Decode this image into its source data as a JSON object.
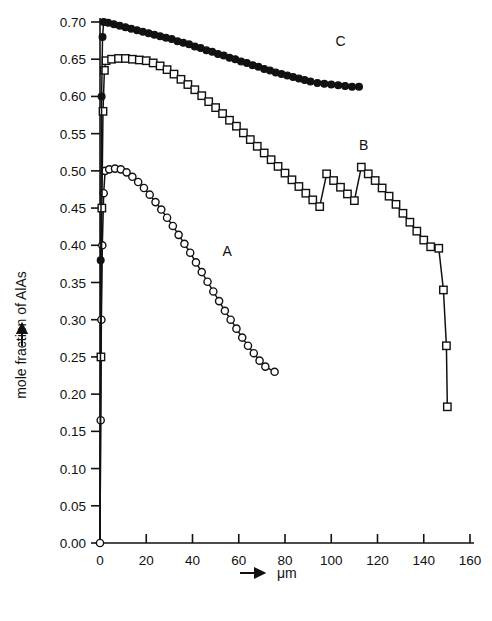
{
  "chart_data": {
    "type": "line",
    "title": "",
    "subtitle": "",
    "xlabel": "μm",
    "xlabel_prefix_icon": "right-arrow",
    "ylabel": "mole fraction of AlAs",
    "ylabel_prefix_icon": "up-arrow",
    "xlim": [
      0,
      160
    ],
    "ylim": [
      0.0,
      0.7
    ],
    "grid": false,
    "legend": "inline-labels",
    "legend_position": "inline",
    "xticks": [
      0,
      20,
      40,
      60,
      80,
      100,
      120,
      140,
      160
    ],
    "xticklabels": [
      "0",
      "20",
      "40",
      "60",
      "80",
      "100",
      "120",
      "140",
      "160"
    ],
    "yticks": [
      0.0,
      0.05,
      0.1,
      0.15,
      0.2,
      0.25,
      0.3,
      0.35,
      0.4,
      0.45,
      0.5,
      0.55,
      0.6,
      0.65,
      0.7
    ],
    "yticklabels": [
      "0.00",
      "0.05",
      "0.10",
      "0.15",
      "0.20",
      "0.25",
      "0.30",
      "0.35",
      "0.40",
      "0.45",
      "0.50",
      "0.55",
      "0.60",
      "0.65",
      "0.70"
    ],
    "series": [
      {
        "name": "A",
        "label": "A",
        "marker": "open-circle",
        "color": "#111111",
        "label_x": 55,
        "label_y": 0.385,
        "points": [
          {
            "x": 0.0,
            "y": 0.0
          },
          {
            "x": 0.3,
            "y": 0.165
          },
          {
            "x": 0.6,
            "y": 0.3
          },
          {
            "x": 1.0,
            "y": 0.4
          },
          {
            "x": 1.6,
            "y": 0.47
          },
          {
            "x": 2.2,
            "y": 0.5
          },
          {
            "x": 4.0,
            "y": 0.502
          },
          {
            "x": 6.5,
            "y": 0.503
          },
          {
            "x": 9.0,
            "y": 0.502
          },
          {
            "x": 11.5,
            "y": 0.498
          },
          {
            "x": 14.0,
            "y": 0.492
          },
          {
            "x": 16.5,
            "y": 0.485
          },
          {
            "x": 19.0,
            "y": 0.477
          },
          {
            "x": 21.5,
            "y": 0.468
          },
          {
            "x": 24.0,
            "y": 0.458
          },
          {
            "x": 26.5,
            "y": 0.448
          },
          {
            "x": 29.0,
            "y": 0.437
          },
          {
            "x": 31.5,
            "y": 0.426
          },
          {
            "x": 34.0,
            "y": 0.414
          },
          {
            "x": 36.5,
            "y": 0.402
          },
          {
            "x": 39.0,
            "y": 0.39
          },
          {
            "x": 41.5,
            "y": 0.377
          },
          {
            "x": 44.0,
            "y": 0.364
          },
          {
            "x": 46.5,
            "y": 0.351
          },
          {
            "x": 49.0,
            "y": 0.338
          },
          {
            "x": 51.5,
            "y": 0.325
          },
          {
            "x": 54.0,
            "y": 0.312
          },
          {
            "x": 56.5,
            "y": 0.3
          },
          {
            "x": 59.0,
            "y": 0.288
          },
          {
            "x": 61.5,
            "y": 0.276
          },
          {
            "x": 64.0,
            "y": 0.265
          },
          {
            "x": 66.5,
            "y": 0.255
          },
          {
            "x": 69.0,
            "y": 0.245
          },
          {
            "x": 71.5,
            "y": 0.237
          },
          {
            "x": 75.5,
            "y": 0.23
          }
        ]
      },
      {
        "name": "B",
        "label": "B",
        "marker": "open-square",
        "color": "#111111",
        "label_x": 114,
        "label_y": 0.528,
        "points": [
          {
            "x": 0.0,
            "y": 0.0
          },
          {
            "x": 0.4,
            "y": 0.25
          },
          {
            "x": 0.8,
            "y": 0.45
          },
          {
            "x": 1.3,
            "y": 0.58
          },
          {
            "x": 1.9,
            "y": 0.635
          },
          {
            "x": 2.6,
            "y": 0.648
          },
          {
            "x": 5.0,
            "y": 0.65
          },
          {
            "x": 8.0,
            "y": 0.651
          },
          {
            "x": 11.0,
            "y": 0.651
          },
          {
            "x": 14.0,
            "y": 0.65
          },
          {
            "x": 17.0,
            "y": 0.649
          },
          {
            "x": 20.0,
            "y": 0.648
          },
          {
            "x": 23.0,
            "y": 0.645
          },
          {
            "x": 26.0,
            "y": 0.641
          },
          {
            "x": 29.0,
            "y": 0.636
          },
          {
            "x": 32.0,
            "y": 0.63
          },
          {
            "x": 35.0,
            "y": 0.623
          },
          {
            "x": 38.0,
            "y": 0.616
          },
          {
            "x": 41.0,
            "y": 0.609
          },
          {
            "x": 44.0,
            "y": 0.601
          },
          {
            "x": 47.0,
            "y": 0.593
          },
          {
            "x": 50.0,
            "y": 0.585
          },
          {
            "x": 53.0,
            "y": 0.577
          },
          {
            "x": 56.0,
            "y": 0.568
          },
          {
            "x": 59.0,
            "y": 0.56
          },
          {
            "x": 62.0,
            "y": 0.551
          },
          {
            "x": 65.0,
            "y": 0.542
          },
          {
            "x": 68.0,
            "y": 0.533
          },
          {
            "x": 71.0,
            "y": 0.524
          },
          {
            "x": 74.0,
            "y": 0.515
          },
          {
            "x": 77.0,
            "y": 0.506
          },
          {
            "x": 80.0,
            "y": 0.497
          },
          {
            "x": 83.0,
            "y": 0.488
          },
          {
            "x": 86.0,
            "y": 0.479
          },
          {
            "x": 89.0,
            "y": 0.47
          },
          {
            "x": 92.0,
            "y": 0.461
          },
          {
            "x": 95.0,
            "y": 0.452
          },
          {
            "x": 98.0,
            "y": 0.496
          },
          {
            "x": 101.0,
            "y": 0.487
          },
          {
            "x": 104.0,
            "y": 0.478
          },
          {
            "x": 107.0,
            "y": 0.469
          },
          {
            "x": 110.0,
            "y": 0.46
          },
          {
            "x": 113.0,
            "y": 0.505
          },
          {
            "x": 116.0,
            "y": 0.496
          },
          {
            "x": 119.0,
            "y": 0.487
          },
          {
            "x": 122.0,
            "y": 0.477
          },
          {
            "x": 125.0,
            "y": 0.466
          },
          {
            "x": 128.0,
            "y": 0.455
          },
          {
            "x": 131.0,
            "y": 0.443
          },
          {
            "x": 134.0,
            "y": 0.431
          },
          {
            "x": 137.0,
            "y": 0.419
          },
          {
            "x": 140.0,
            "y": 0.407
          },
          {
            "x": 143.0,
            "y": 0.398
          },
          {
            "x": 146.5,
            "y": 0.396
          },
          {
            "x": 148.5,
            "y": 0.34
          },
          {
            "x": 149.8,
            "y": 0.265
          },
          {
            "x": 150.2,
            "y": 0.183
          }
        ]
      },
      {
        "name": "C",
        "label": "C",
        "marker": "filled-circle",
        "color": "#111111",
        "label_x": 104,
        "label_y": 0.668,
        "points": [
          {
            "x": 0.0,
            "y": 0.0
          },
          {
            "x": 0.3,
            "y": 0.38
          },
          {
            "x": 0.7,
            "y": 0.6
          },
          {
            "x": 1.1,
            "y": 0.68
          },
          {
            "x": 1.6,
            "y": 0.7
          },
          {
            "x": 3.5,
            "y": 0.699
          },
          {
            "x": 6.0,
            "y": 0.697
          },
          {
            "x": 8.5,
            "y": 0.695
          },
          {
            "x": 11.0,
            "y": 0.693
          },
          {
            "x": 13.5,
            "y": 0.691
          },
          {
            "x": 16.0,
            "y": 0.689
          },
          {
            "x": 18.5,
            "y": 0.687
          },
          {
            "x": 21.0,
            "y": 0.685
          },
          {
            "x": 23.5,
            "y": 0.683
          },
          {
            "x": 26.0,
            "y": 0.681
          },
          {
            "x": 28.5,
            "y": 0.679
          },
          {
            "x": 31.0,
            "y": 0.677
          },
          {
            "x": 33.5,
            "y": 0.674
          },
          {
            "x": 36.0,
            "y": 0.672
          },
          {
            "x": 38.5,
            "y": 0.67
          },
          {
            "x": 41.0,
            "y": 0.667
          },
          {
            "x": 43.5,
            "y": 0.665
          },
          {
            "x": 46.0,
            "y": 0.662
          },
          {
            "x": 48.5,
            "y": 0.66
          },
          {
            "x": 51.0,
            "y": 0.657
          },
          {
            "x": 53.5,
            "y": 0.655
          },
          {
            "x": 56.0,
            "y": 0.652
          },
          {
            "x": 58.5,
            "y": 0.65
          },
          {
            "x": 61.0,
            "y": 0.647
          },
          {
            "x": 63.5,
            "y": 0.645
          },
          {
            "x": 66.0,
            "y": 0.642
          },
          {
            "x": 68.5,
            "y": 0.64
          },
          {
            "x": 71.0,
            "y": 0.637
          },
          {
            "x": 73.5,
            "y": 0.635
          },
          {
            "x": 76.0,
            "y": 0.632
          },
          {
            "x": 78.5,
            "y": 0.63
          },
          {
            "x": 81.0,
            "y": 0.628
          },
          {
            "x": 83.5,
            "y": 0.626
          },
          {
            "x": 86.0,
            "y": 0.624
          },
          {
            "x": 88.5,
            "y": 0.622
          },
          {
            "x": 91.0,
            "y": 0.62
          },
          {
            "x": 94.0,
            "y": 0.618
          },
          {
            "x": 97.0,
            "y": 0.617
          },
          {
            "x": 100.0,
            "y": 0.616
          },
          {
            "x": 103.0,
            "y": 0.615
          },
          {
            "x": 106.0,
            "y": 0.614
          },
          {
            "x": 109.0,
            "y": 0.613
          },
          {
            "x": 112.0,
            "y": 0.613
          }
        ]
      }
    ]
  }
}
